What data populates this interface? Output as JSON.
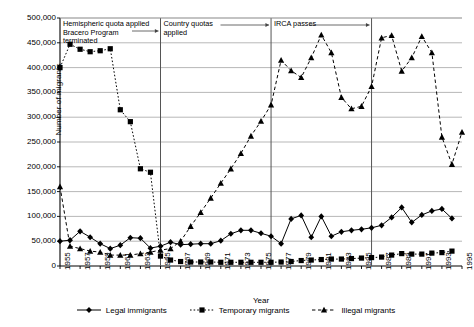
{
  "chart_data": {
    "type": "line",
    "title": "",
    "xlabel": "Year",
    "ylabel": "Number of migrants",
    "xlim": [
      1955,
      1995
    ],
    "ylim": [
      0,
      500000
    ],
    "ytick_step": 50000,
    "grid": true,
    "legend_position": "bottom",
    "ytick_labels": [
      "0",
      "50,000",
      "100,000",
      "150,000",
      "200,000",
      "250,000",
      "300,000",
      "350,000",
      "400,000",
      "450,000",
      "500,000"
    ],
    "ytick_values": [
      0,
      50000,
      100000,
      150000,
      200000,
      250000,
      300000,
      350000,
      400000,
      450000,
      500000
    ],
    "xtick_labels": [
      "1955",
      "1957",
      "1959",
      "1961",
      "1963",
      "1965",
      "1967",
      "1969",
      "1971",
      "1973",
      "1975",
      "1977",
      "1979",
      "1981",
      "1983",
      "1985",
      "1987",
      "1989",
      "1991",
      "1993",
      "1995"
    ],
    "xtick_values": [
      1955,
      1957,
      1959,
      1961,
      1963,
      1965,
      1967,
      1969,
      1971,
      1973,
      1975,
      1977,
      1979,
      1981,
      1983,
      1985,
      1987,
      1989,
      1991,
      1993,
      1995
    ],
    "x": [
      1955,
      1956,
      1957,
      1958,
      1959,
      1960,
      1961,
      1962,
      1963,
      1964,
      1965,
      1966,
      1967,
      1968,
      1969,
      1970,
      1971,
      1972,
      1973,
      1974,
      1975,
      1976,
      1977,
      1978,
      1979,
      1980,
      1981,
      1982,
      1983,
      1984,
      1985,
      1986,
      1987,
      1988,
      1989,
      1990,
      1991,
      1992,
      1993,
      1994,
      1995
    ],
    "series": [
      {
        "name": "Legal immigrants",
        "marker": "diamond",
        "linestyle": "solid",
        "color": "#000000",
        "values": [
          50000,
          52000,
          70000,
          58000,
          45000,
          35000,
          42000,
          57000,
          56000,
          36000,
          40000,
          48000,
          43000,
          44000,
          45000,
          45000,
          51000,
          65000,
          72000,
          72000,
          66000,
          60000,
          45000,
          95000,
          102000,
          58000,
          100000,
          60000,
          69000,
          72000,
          74000,
          77000,
          82000,
          98000,
          118000,
          88000,
          103000,
          111000,
          115000,
          96000,
          0
        ]
      },
      {
        "name": "Temporary migrants",
        "marker": "square",
        "linestyle": "dotted",
        "color": "#000000",
        "values": [
          400000,
          447000,
          437000,
          432000,
          434000,
          438000,
          315000,
          291000,
          196000,
          189000,
          20000,
          12000,
          9000,
          8000,
          8000,
          8000,
          7500,
          7500,
          7500,
          7500,
          7500,
          7500,
          8000,
          9000,
          11000,
          12000,
          13000,
          14000,
          14000,
          15000,
          16000,
          17000,
          18000,
          22000,
          25000,
          24000,
          24000,
          26000,
          27000,
          30000,
          0
        ]
      },
      {
        "name": "Illegal migrants",
        "marker": "triangle",
        "linestyle": "dashed",
        "color": "#000000",
        "values": [
          160000,
          40000,
          35000,
          30000,
          28000,
          22000,
          22000,
          22000,
          25000,
          28000,
          32000,
          35000,
          50000,
          80000,
          108000,
          137000,
          167000,
          196000,
          227000,
          262000,
          292000,
          325000,
          415000,
          394000,
          380000,
          420000,
          466000,
          430000,
          340000,
          317000,
          322000,
          362000,
          460000,
          465000,
          393000,
          420000,
          463000,
          430000,
          260000,
          205000,
          270000
        ]
      }
    ],
    "annotations": [
      {
        "id": "ann-hemispheric",
        "text": "Hemispheric quota applied\nBracero Program\nterminated",
        "arrow_from": 1955,
        "arrow_to": 1965,
        "marker_year": 1965
      },
      {
        "id": "ann-country",
        "text": "Country quotas\napplied",
        "arrow_from": 1965,
        "arrow_to": 1976,
        "marker_year": 1976
      },
      {
        "id": "ann-irca",
        "text": "IRCA passes",
        "arrow_from": 1976,
        "arrow_to": 1986,
        "marker_year": 1986
      }
    ],
    "vlines": [
      1965,
      1976,
      1986
    ]
  },
  "legend": {
    "items": [
      {
        "label": "Legal immigrants",
        "marker": "diamond",
        "linestyle": "solid"
      },
      {
        "label": "Temporary migrants",
        "marker": "square",
        "linestyle": "dotted"
      },
      {
        "label": "Illegal migrants",
        "marker": "triangle",
        "linestyle": "dashed"
      }
    ]
  }
}
